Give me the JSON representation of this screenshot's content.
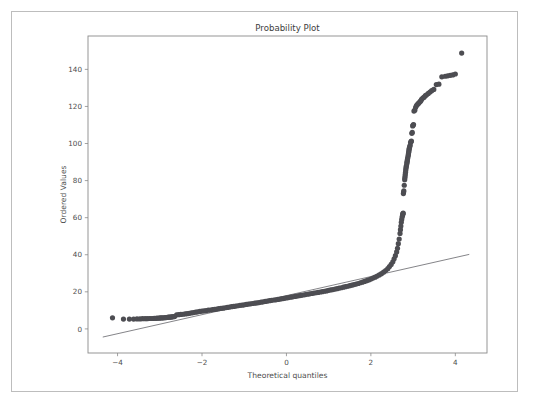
{
  "figure": {
    "width": 534,
    "height": 405,
    "background_color": "#ffffff",
    "outer_border_color": "#bdbdbd"
  },
  "chart_data": {
    "type": "scatter",
    "title": "Probability Plot",
    "xlabel": "Theoretical quantiles",
    "ylabel": "Ordered Values",
    "xlim": [
      -4.7,
      4.75
    ],
    "ylim": [
      -13,
      158
    ],
    "xticks": [
      -4,
      -2,
      0,
      2,
      4
    ],
    "xticklabels": [
      "−4",
      "−2",
      "0",
      "2",
      "4"
    ],
    "yticks": [
      0,
      20,
      40,
      60,
      80,
      100,
      120,
      140
    ],
    "yticklabels": [
      "0",
      "20",
      "40",
      "60",
      "80",
      "100",
      "120",
      "140"
    ],
    "grid": false,
    "legend": null,
    "marker_color": "#4d4d52",
    "marker_size": 2.6,
    "line_color": "#6e6e73",
    "series": [
      {
        "name": "Ordered Values",
        "type": "scatter",
        "x": [
          -4.12,
          -3.86,
          -3.72,
          -3.62,
          -3.54,
          -3.47,
          -3.41,
          -3.35,
          -3.3,
          -3.25,
          -3.21,
          -3.17,
          -3.13,
          -3.09,
          -3.06,
          -3.02,
          -2.99,
          -2.96,
          -2.93,
          -2.9,
          -2.87,
          -2.85,
          -2.82,
          -2.79,
          -2.77,
          -2.74,
          -2.72,
          -2.7,
          -2.67,
          -2.65,
          -2.6,
          -2.55,
          -2.5,
          -2.45,
          -2.4,
          -2.35,
          -2.3,
          -2.25,
          -2.2,
          -2.15,
          -2.1,
          -2.05,
          -2.0,
          -1.95,
          -1.9,
          -1.85,
          -1.8,
          -1.75,
          -1.7,
          -1.65,
          -1.6,
          -1.55,
          -1.5,
          -1.45,
          -1.4,
          -1.35,
          -1.3,
          -1.25,
          -1.2,
          -1.15,
          -1.1,
          -1.05,
          -1.0,
          -0.95,
          -0.9,
          -0.85,
          -0.8,
          -0.75,
          -0.7,
          -0.65,
          -0.6,
          -0.55,
          -0.5,
          -0.45,
          -0.4,
          -0.35,
          -0.3,
          -0.25,
          -0.2,
          -0.15,
          -0.1,
          -0.05,
          0.0,
          0.05,
          0.1,
          0.15,
          0.2,
          0.25,
          0.3,
          0.35,
          0.4,
          0.45,
          0.5,
          0.55,
          0.6,
          0.65,
          0.7,
          0.75,
          0.8,
          0.85,
          0.9,
          0.95,
          1.0,
          1.05,
          1.1,
          1.15,
          1.2,
          1.25,
          1.3,
          1.35,
          1.4,
          1.45,
          1.5,
          1.55,
          1.6,
          1.65,
          1.7,
          1.75,
          1.8,
          1.85,
          1.9,
          1.95,
          2.0,
          2.05,
          2.1,
          2.15,
          2.2,
          2.25,
          2.3,
          2.35,
          2.4,
          2.44,
          2.48,
          2.52,
          2.55,
          2.58,
          2.61,
          2.63,
          2.65,
          2.67,
          2.69,
          2.7,
          2.71,
          2.72,
          2.73,
          2.74,
          2.75,
          2.755,
          2.76,
          2.765,
          2.77,
          2.775,
          2.78,
          2.79,
          2.8,
          2.805,
          2.81,
          2.815,
          2.82,
          2.825,
          2.83,
          2.835,
          2.84,
          2.85,
          2.855,
          2.86,
          2.865,
          2.87,
          2.88,
          2.885,
          2.89,
          2.895,
          2.9,
          2.905,
          2.91,
          2.92,
          2.93,
          2.94,
          2.95,
          2.96,
          2.97,
          2.98,
          2.99,
          3.0,
          3.01,
          3.02,
          3.04,
          3.06,
          3.08,
          3.1,
          3.12,
          3.14,
          3.16,
          3.18,
          3.2,
          3.23,
          3.26,
          3.29,
          3.32,
          3.36,
          3.4,
          3.44,
          3.49,
          3.55,
          3.61,
          3.68,
          3.76,
          3.82,
          3.88,
          3.94,
          4.0,
          4.15
        ],
        "y": [
          6.0,
          5.3,
          5.3,
          5.3,
          5.4,
          5.4,
          5.5,
          5.5,
          5.5,
          5.6,
          5.6,
          5.6,
          5.7,
          5.7,
          5.8,
          5.8,
          5.9,
          5.9,
          6.0,
          6.0,
          6.1,
          6.1,
          6.2,
          6.3,
          6.3,
          6.4,
          6.5,
          6.5,
          6.6,
          6.7,
          7.6,
          7.7,
          7.8,
          7.9,
          8.1,
          8.2,
          8.4,
          8.6,
          8.8,
          9.0,
          9.2,
          9.4,
          9.6,
          9.7,
          9.9,
          10.1,
          10.2,
          10.4,
          10.5,
          10.7,
          10.9,
          11.1,
          11.2,
          11.4,
          11.6,
          11.8,
          12.0,
          12.1,
          12.3,
          12.5,
          12.7,
          12.8,
          13.0,
          13.2,
          13.4,
          13.5,
          13.7,
          13.9,
          14.0,
          14.2,
          14.4,
          14.6,
          14.8,
          15.0,
          15.2,
          15.4,
          15.6,
          15.7,
          15.9,
          16.1,
          16.3,
          16.5,
          16.7,
          16.9,
          17.1,
          17.3,
          17.5,
          17.7,
          17.9,
          18.1,
          18.3,
          18.5,
          18.7,
          18.9,
          19.1,
          19.3,
          19.5,
          19.7,
          19.9,
          20.1,
          20.3,
          20.5,
          20.8,
          21.0,
          21.2,
          21.5,
          21.7,
          22.0,
          22.2,
          22.5,
          22.8,
          23.0,
          23.3,
          23.6,
          23.9,
          24.2,
          24.5,
          24.9,
          25.2,
          25.6,
          26.0,
          26.4,
          26.9,
          27.4,
          27.9,
          28.5,
          29.1,
          29.8,
          30.6,
          31.5,
          32.5,
          33.6,
          34.8,
          36.2,
          37.8,
          39.5,
          41.5,
          43.5,
          46.0,
          48.5,
          51.5,
          53.5,
          55.5,
          57.5,
          59.0,
          60.3,
          61.2,
          61.8,
          62.2,
          62.5,
          73.0,
          73.8,
          74.5,
          77.5,
          80.5,
          81.5,
          82.5,
          83.5,
          84.5,
          85.5,
          86.5,
          87.3,
          88.0,
          89.0,
          89.8,
          90.5,
          91.3,
          92.0,
          93.0,
          93.8,
          94.5,
          95.3,
          96.0,
          96.8,
          97.5,
          98.3,
          99.0,
          100.5,
          101.0,
          101.3,
          105.5,
          106.0,
          109.5,
          110.0,
          110.2,
          117.5,
          118.0,
          119.5,
          120.5,
          121.0,
          121.5,
          122.0,
          122.5,
          123.0,
          123.8,
          124.5,
          125.0,
          125.8,
          126.3,
          127.0,
          127.8,
          128.5,
          129.2,
          131.8,
          132.0,
          136.0,
          136.3,
          136.5,
          136.8,
          137.0,
          137.5,
          148.8
        ]
      },
      {
        "name": "Fit line",
        "type": "line",
        "x": [
          -4.35,
          4.33
        ],
        "y": [
          -4.4,
          40.2
        ]
      }
    ]
  }
}
